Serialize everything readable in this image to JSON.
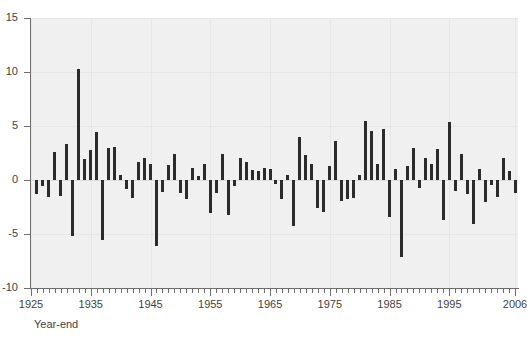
{
  "chart_data": {
    "type": "bar",
    "title": "",
    "subtitle": "",
    "xlabel": "Year-end",
    "ylabel": "",
    "xlim": [
      1925,
      2006.5
    ],
    "ylim": [
      -10,
      15
    ],
    "grid": true,
    "legend": null,
    "y_ticks": [
      15,
      10,
      5,
      0,
      -5,
      -10
    ],
    "y_tick_labels": [
      "15",
      "10",
      "5",
      "0",
      "-5",
      "-10"
    ],
    "x_ticks": [
      1925,
      1935,
      1945,
      1955,
      1965,
      1975,
      1985,
      1995,
      2006
    ],
    "x_tick_labels": [
      "1925",
      "1935",
      "1945",
      "1955",
      "1965",
      "1975",
      "1985",
      "1995",
      "2006"
    ],
    "x_minor_tick_step": 1,
    "bar_color": "#2b2b2b",
    "plot_background": "#f0f0f0",
    "categories": [
      1926,
      1927,
      1928,
      1929,
      1930,
      1931,
      1932,
      1933,
      1934,
      1935,
      1936,
      1937,
      1938,
      1939,
      1940,
      1941,
      1942,
      1943,
      1944,
      1945,
      1946,
      1947,
      1948,
      1949,
      1950,
      1951,
      1952,
      1953,
      1954,
      1955,
      1956,
      1957,
      1958,
      1959,
      1960,
      1961,
      1962,
      1963,
      1964,
      1965,
      1966,
      1967,
      1968,
      1969,
      1970,
      1971,
      1972,
      1973,
      1974,
      1975,
      1976,
      1977,
      1978,
      1979,
      1980,
      1981,
      1982,
      1983,
      1984,
      1985,
      1986,
      1987,
      1988,
      1989,
      1990,
      1991,
      1992,
      1993,
      1994,
      1995,
      1996,
      1997,
      1998,
      1999,
      2000,
      2001,
      2002,
      2003,
      2004,
      2005,
      2006
    ],
    "values": [
      -1.3,
      -0.6,
      -1.6,
      2.6,
      -1.5,
      3.3,
      -5.2,
      10.3,
      1.9,
      2.8,
      4.4,
      -5.6,
      3.0,
      3.1,
      0.5,
      -0.8,
      -1.7,
      1.7,
      2.0,
      1.5,
      -6.1,
      -1.1,
      1.4,
      2.4,
      -1.2,
      -1.8,
      1.1,
      0.4,
      1.5,
      -3.1,
      -1.2,
      2.4,
      -3.2,
      -0.6,
      2.0,
      1.7,
      0.9,
      0.8,
      1.1,
      1.0,
      -0.4,
      -1.8,
      0.5,
      -4.3,
      4.0,
      2.3,
      1.5,
      -2.6,
      -3.0,
      1.3,
      3.6,
      -1.9,
      -1.8,
      -1.7,
      0.5,
      5.5,
      4.5,
      1.5,
      4.7,
      -3.4,
      1.0,
      -7.1,
      1.3,
      3.0,
      -0.7,
      2.0,
      1.5,
      2.9,
      -3.7,
      5.4,
      -1.0,
      2.4,
      -1.3,
      -4.1,
      1.0,
      -2.0,
      -0.5,
      -1.6,
      2.0,
      0.8,
      -1.2
    ]
  }
}
